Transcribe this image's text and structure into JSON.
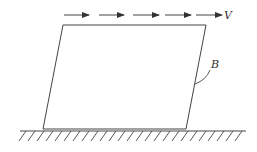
{
  "diagram": {
    "colors": {
      "stroke": "#444444",
      "background": "#ffffff"
    },
    "labels": {
      "velocity": "V",
      "boundary": "B"
    },
    "arrows": [
      {
        "x1": 64,
        "x2": 89,
        "y": 15
      },
      {
        "x1": 99,
        "x2": 124,
        "y": 15
      },
      {
        "x1": 133,
        "x2": 159,
        "y": 15
      },
      {
        "x1": 165,
        "x2": 191,
        "y": 15
      },
      {
        "x1": 196,
        "x2": 222,
        "y": 15
      }
    ],
    "block": {
      "shape": "parallelogram",
      "points": [
        [
          63,
          25
        ],
        [
          206,
          25
        ],
        [
          186,
          129
        ],
        [
          43,
          129
        ]
      ]
    },
    "ground": {
      "x1": 20,
      "x2": 246,
      "y": 131,
      "hatch_spacing": 9
    }
  }
}
